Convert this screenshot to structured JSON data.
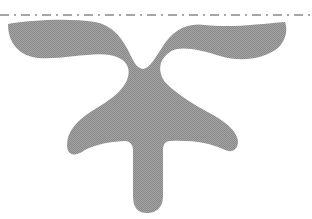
{
  "figure": {
    "colors": {
      "fill": "#999999",
      "dashed_line": "#a6a6a6",
      "background": "#ffffff"
    },
    "guide_line": {
      "style": "dash-dot",
      "y": 15
    }
  }
}
